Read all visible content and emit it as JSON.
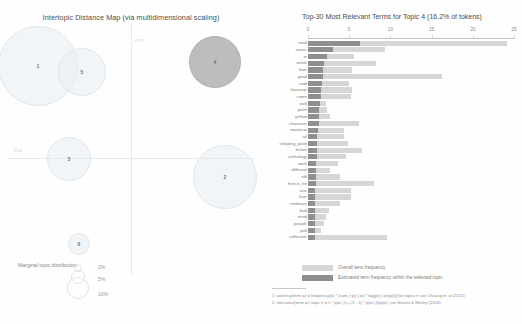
{
  "mds": {
    "title": "Intertopic Distance Map (via multidimensional scaling)",
    "axis_x_label": "PC1",
    "axis_y_label": "PC2",
    "marginal_label": "Marginal topic distribution",
    "legend_percents": [
      "2%",
      "5%",
      "10%"
    ],
    "topics": [
      {
        "id": "1",
        "cx": 38,
        "cy": 66,
        "r": 40,
        "selected": false
      },
      {
        "id": "5",
        "cx": 82,
        "cy": 72,
        "r": 24,
        "selected": false
      },
      {
        "id": "4",
        "cx": 215,
        "cy": 62,
        "r": 26,
        "selected": true
      },
      {
        "id": "3",
        "cx": 69,
        "cy": 159,
        "r": 22,
        "selected": false
      },
      {
        "id": "2",
        "cx": 225,
        "cy": 177,
        "r": 32,
        "selected": false
      },
      {
        "id": "6",
        "cx": 79,
        "cy": 244,
        "r": 11,
        "selected": false
      }
    ]
  },
  "bar_chart": {
    "title": "Top-30 Most Relevant Terms for Topic 4 (16.2% of tokens)",
    "legend": {
      "overall_label": "Overall term frequency",
      "topic_label": "Estimated term frequency within the selected topic"
    },
    "footnotes": [
      "1. saliency(term w) = frequency(w) * [sum_t p(t | w) * log(p(t | w)/p(t))] for topics t; see Chuang et. al (2012)",
      "2. relevance(term w | topic t) = λ * p(w | t) + (1 - λ) * p(w | t)/p(w); see Sievert & Shirley (2014)"
    ]
  },
  "chart_data": {
    "type": "bar",
    "title": "Top-30 Most Relevant Terms for Topic 4 (16.2% of tokens)",
    "xlabel": "",
    "ylabel": "",
    "xlim": [
      0,
      25
    ],
    "ticks": [
      0,
      5,
      10,
      15,
      20,
      25
    ],
    "grid": false,
    "orientation": "horizontal",
    "legend_position": "bottom",
    "categories": [
      "read",
      "series",
      "in",
      "writer",
      "love",
      "good",
      "said",
      "favourite",
      "come",
      "well",
      "point",
      "yellow",
      "character",
      "motorcat",
      "oil",
      "sleeping_point",
      "fiction",
      "anthology",
      "work",
      "different",
      "old",
      "french_fre",
      "one",
      "love",
      "embrace",
      "bad",
      "mind",
      "people",
      "poll",
      "collection"
    ],
    "series": [
      {
        "name": "Overall term frequency",
        "values": [
          24.2,
          9.4,
          5.6,
          8.2,
          5.4,
          16.3,
          5.0,
          5.4,
          5.2,
          2.2,
          2.3,
          2.7,
          6.2,
          4.4,
          4.4,
          4.9,
          6.5,
          4.6,
          3.7,
          2.7,
          3.9,
          8.0,
          5.2,
          5.2,
          3.9,
          2.6,
          2.2,
          1.9,
          1.6,
          9.6
        ]
      },
      {
        "name": "Estimated term frequency within the selected topic",
        "values": [
          6.3,
          3.0,
          2.3,
          1.9,
          1.8,
          1.8,
          1.7,
          1.6,
          1.6,
          1.4,
          1.3,
          1.3,
          1.3,
          1.2,
          1.1,
          1.1,
          1.1,
          1.1,
          1.0,
          1.0,
          1.0,
          1.0,
          0.9,
          0.9,
          0.9,
          0.8,
          0.8,
          0.8,
          0.8,
          0.8
        ]
      }
    ]
  }
}
